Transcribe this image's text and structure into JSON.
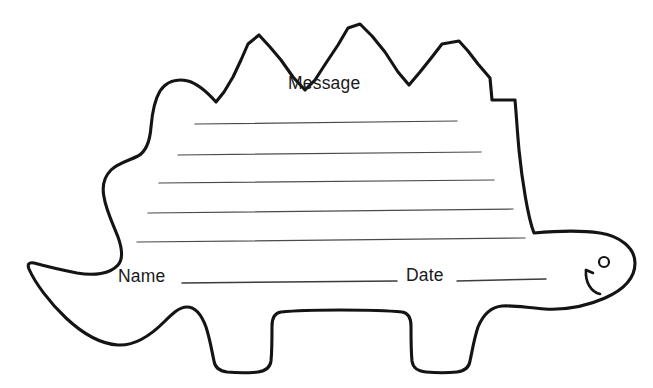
{
  "page": {
    "background_color": "#ffffff",
    "outline_color": "#141414",
    "rule_line_color": "#4a4a4a",
    "width": 653,
    "height": 388
  },
  "shape": {
    "name": "stegosaurus-note-outline",
    "description": "Stegosaurus outline with three back plates, curled tail, two legs, and a head with eye and mouth",
    "spike_count": 3,
    "leg_count": 2
  },
  "labels": {
    "message": "Message",
    "name": "Name",
    "date": "Date"
  },
  "message_lines": {
    "count": 5,
    "lines": [
      {
        "x1": 195,
        "y1": 124,
        "x2": 457,
        "y2": 121
      },
      {
        "x1": 178,
        "y1": 155,
        "x2": 481,
        "y2": 152
      },
      {
        "x1": 159,
        "y1": 183,
        "x2": 494,
        "y2": 180
      },
      {
        "x1": 148,
        "y1": 213,
        "x2": 513,
        "y2": 209
      },
      {
        "x1": 137,
        "y1": 242,
        "x2": 525,
        "y2": 238
      }
    ]
  },
  "field_lines": {
    "name_line": {
      "x1": 182,
      "y1": 283,
      "x2": 397,
      "y2": 281
    },
    "date_line": {
      "x1": 457,
      "y1": 281,
      "x2": 546,
      "y2": 279
    }
  },
  "face": {
    "eye": {
      "cx": 604,
      "cy": 262,
      "r": 5.0
    },
    "mouth_description": "upward curved smile below the eye"
  },
  "icons": {
    "eye": "eye-dot-icon",
    "mouth": "smile-curve-icon"
  }
}
